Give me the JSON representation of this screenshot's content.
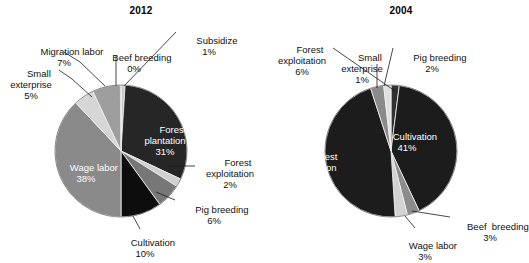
{
  "figure": {
    "width": 529,
    "height": 263,
    "background": "#ffffff"
  },
  "chart_data": [
    {
      "type": "pie",
      "title": "2012",
      "xlabel": "",
      "ylabel": "",
      "legend_position": "none",
      "grid": false,
      "label_format": "name + percent",
      "categories": [
        "Subsidize",
        "Forest plantation",
        "Forest exploitation",
        "Pig breeding",
        "Cultivation",
        "Wage labor",
        "Small exterprise",
        "Migration labor",
        "Beef breeding"
      ],
      "values": [
        1,
        31,
        2,
        6,
        10,
        38,
        5,
        7,
        0
      ],
      "unit": "%",
      "slices": [
        {
          "name": "Subsidize",
          "value": 1,
          "percent_label": "1%",
          "color": "#c9c9c9",
          "start_deg": 0,
          "end_deg": 3.6,
          "label_placement": "callout"
        },
        {
          "name": "Forest plantation",
          "value": 31,
          "percent_label": "31%",
          "color": "#262626",
          "start_deg": 3.6,
          "end_deg": 115.2,
          "label_placement": "inside"
        },
        {
          "name": "Forest exploitation",
          "value": 2,
          "percent_label": "2%",
          "color": "#d0d0d0",
          "start_deg": 115.2,
          "end_deg": 122.4,
          "label_placement": "callout"
        },
        {
          "name": "Pig breeding",
          "value": 6,
          "percent_label": "6%",
          "color": "#777777",
          "start_deg": 122.4,
          "end_deg": 144.0,
          "label_placement": "callout"
        },
        {
          "name": "Cultivation",
          "value": 10,
          "percent_label": "10%",
          "color": "#0d0d0d",
          "start_deg": 144.0,
          "end_deg": 180.0,
          "label_placement": "callout"
        },
        {
          "name": "Wage labor",
          "value": 38,
          "percent_label": "38%",
          "color": "#8a8a8a",
          "start_deg": 180.0,
          "end_deg": 316.8,
          "label_placement": "inside"
        },
        {
          "name": "Small exterprise",
          "value": 5,
          "percent_label": "5%",
          "color": "#d6d6d6",
          "start_deg": 316.8,
          "end_deg": 334.8,
          "label_placement": "callout"
        },
        {
          "name": "Migration labor",
          "value": 7,
          "percent_label": "7%",
          "color": "#9e9e9e",
          "start_deg": 334.8,
          "end_deg": 360.0,
          "label_placement": "callout"
        },
        {
          "name": "Beef breeding",
          "value": 0,
          "percent_label": "0%",
          "color": "#9a9a9a",
          "start_deg": 359.4,
          "end_deg": 360.0,
          "label_placement": "callout"
        }
      ]
    },
    {
      "type": "pie",
      "title": "2004",
      "xlabel": "",
      "ylabel": "",
      "legend_position": "none",
      "grid": false,
      "label_format": "name + percent",
      "categories": [
        "Pig breeding",
        "Cultivation",
        "Beef breeding",
        "Wage labor",
        "Forest plantation",
        "Forest exploitation",
        "Small exterprise"
      ],
      "values": [
        2,
        41,
        3,
        3,
        46,
        6,
        1
      ],
      "unit": "%",
      "slices": [
        {
          "name": "Pig breeding",
          "value": 2,
          "percent_label": "2%",
          "color": "#303030",
          "start_deg": 0,
          "end_deg": 7.2,
          "label_placement": "callout"
        },
        {
          "name": "Cultivation",
          "value": 41,
          "percent_label": "41%",
          "color": "#1c1c1c",
          "start_deg": 7.2,
          "end_deg": 154.8,
          "label_placement": "inside"
        },
        {
          "name": "Beef breeding",
          "value": 3,
          "percent_label": "3%",
          "color": "#8c8c8c",
          "start_deg": 154.8,
          "end_deg": 165.6,
          "label_placement": "callout"
        },
        {
          "name": "Wage labor",
          "value": 3,
          "percent_label": "3%",
          "color": "#d2d2d2",
          "start_deg": 165.6,
          "end_deg": 176.4,
          "label_placement": "callout"
        },
        {
          "name": "Forest plantation",
          "value": 46,
          "percent_label": "46%",
          "color": "#1c1c1c",
          "start_deg": 176.4,
          "end_deg": 342.0,
          "label_placement": "inside"
        },
        {
          "name": "Forest exploitation",
          "value": 6,
          "percent_label": "6%",
          "color": "#8a8a8a",
          "start_deg": 342.0,
          "end_deg": 353.6,
          "label_placement": "callout"
        },
        {
          "name": "Small exterprise",
          "value": 1,
          "percent_label": "1%",
          "color": "#e0e0e0",
          "start_deg": 353.6,
          "end_deg": 360.0,
          "label_placement": "callout"
        }
      ]
    }
  ],
  "panel_2012": {
    "title": "2012",
    "inside_labels": {
      "forest_plantation": {
        "name": "Forest\nplantation",
        "percent": "31%"
      },
      "wage_labor": {
        "name": "Wage labor",
        "percent": "38%"
      }
    },
    "callouts": {
      "migration_labor": {
        "name": "Migration labor",
        "percent": "7%"
      },
      "small_exterprise": {
        "name": "Small\nexterprise",
        "percent": "5%"
      },
      "beef_breeding": {
        "name": "Beef breeding",
        "percent": "0%"
      },
      "subsidize": {
        "name": "Subsidize",
        "percent": "1%"
      },
      "forest_exploitation": {
        "name": "Forest\nexploitation",
        "percent": "2%"
      },
      "pig_breeding": {
        "name": "Pig breeding",
        "percent": "6%"
      },
      "cultivation": {
        "name": "Cultivation",
        "percent": "10%"
      }
    }
  },
  "panel_2004": {
    "title": "2004",
    "inside_labels": {
      "cultivation": {
        "name": "Cultivation",
        "percent": "41%"
      },
      "forest_plantation": {
        "name": "Forest\nplantation",
        "percent": "46%"
      }
    },
    "callouts": {
      "forest_exploitation": {
        "name": "Forest\nexploitation",
        "percent": "6%"
      },
      "small_exterprise": {
        "name": "Small\nexterprise",
        "percent": "1%"
      },
      "pig_breeding": {
        "name": "Pig breeding",
        "percent": "2%"
      },
      "beef_breeding": {
        "name": "Beef  breeding",
        "percent": "3%"
      },
      "wage_labor": {
        "name": "Wage labor",
        "percent": "3%"
      }
    }
  }
}
